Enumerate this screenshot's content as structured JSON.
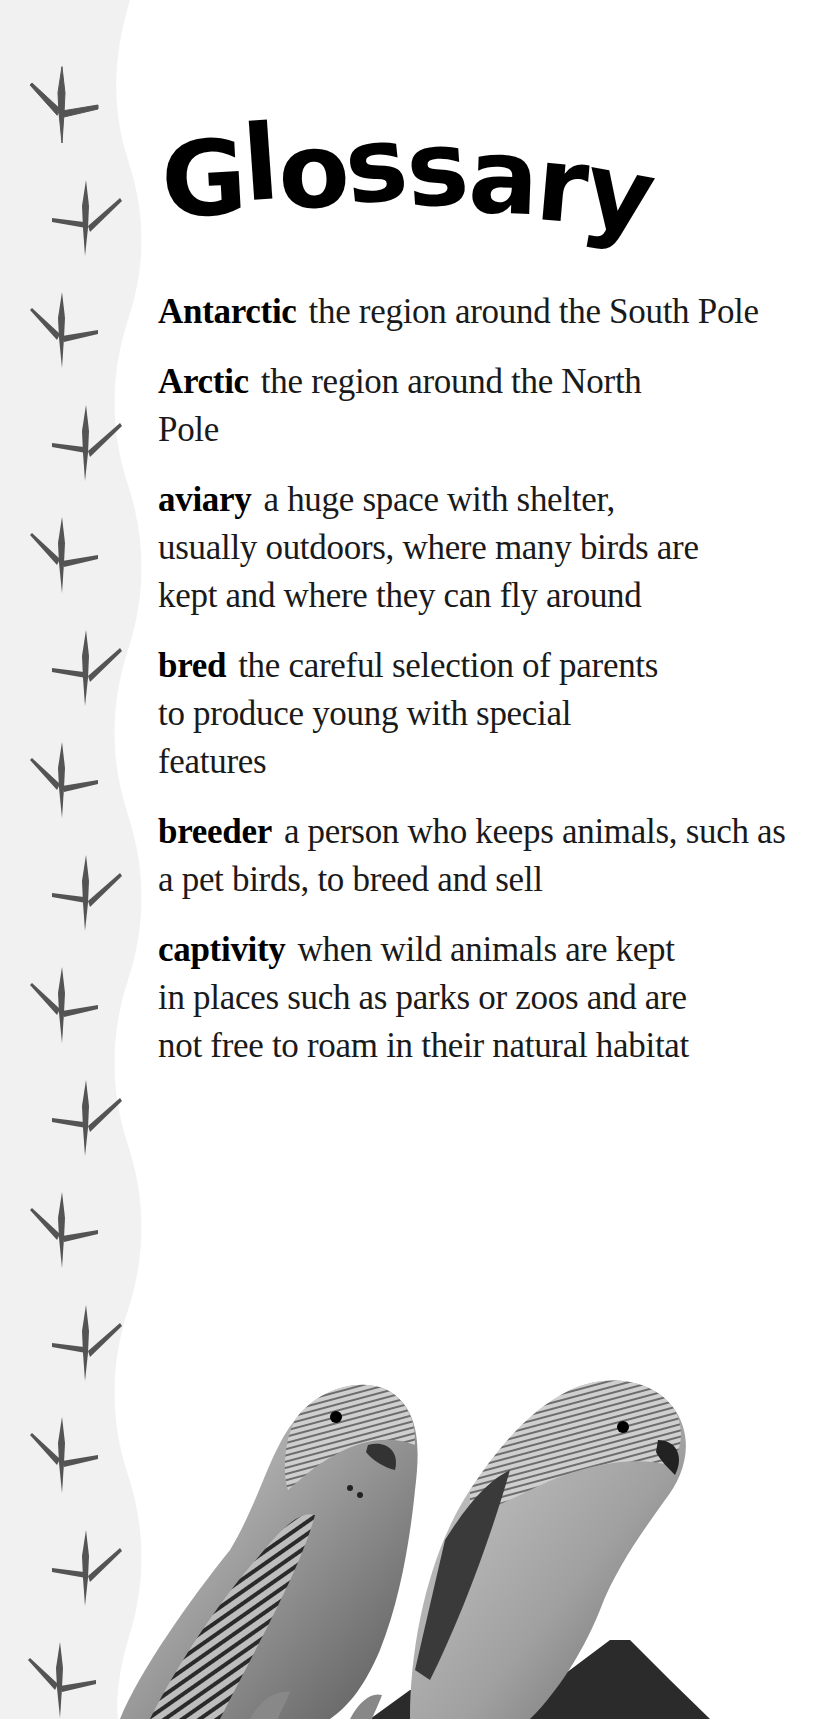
{
  "page": {
    "title": "Glossary",
    "title_letters": [
      "G",
      "l",
      "o",
      "s",
      "s",
      "a",
      "r",
      "y"
    ],
    "colors": {
      "background": "#ffffff",
      "side_band": "#f1f1f1",
      "footprint": "#545454",
      "title": "#000000",
      "text": "#1a1a1a"
    }
  },
  "glossary": [
    {
      "term": "Antarctic",
      "definition": "the region around the South Pole"
    },
    {
      "term": "Arctic",
      "definition": "the region around the North Pole"
    },
    {
      "term": "aviary",
      "definition": "a huge space with shelter, usually outdoors, where many birds are kept and where they can fly around"
    },
    {
      "term": "bred",
      "definition": "the careful selection of parents to produce young with special features"
    },
    {
      "term": "breeder",
      "definition": "a person who keeps animals, such as a pet birds, to breed and sell"
    },
    {
      "term": "captivity",
      "definition": "when wild animals are kept in places such as parks or zoos and are not free to roam in their natural habitat"
    }
  ],
  "decorations": {
    "side_icon": "bird-footprint-icon",
    "footprint_count": 15,
    "photo": "two-budgerigars-on-perch"
  }
}
